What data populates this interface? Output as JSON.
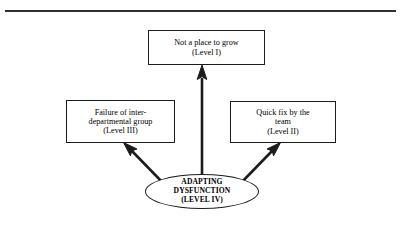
{
  "figure": {
    "type": "flow-diagram",
    "divider": {
      "name": "top-horizontal-rule",
      "color": "#303030"
    },
    "nodes": [
      {
        "id": "level1",
        "shape": "rectangle",
        "lines": [
          "Not a place to grow",
          "(Level I)"
        ],
        "level_label": "(Level I)"
      },
      {
        "id": "level3",
        "shape": "rectangle",
        "lines": [
          "Failure of inter-",
          "departmental group",
          "(Level III)"
        ],
        "level_label": "(Level III)"
      },
      {
        "id": "level2",
        "shape": "rectangle",
        "lines": [
          "Quick fix by the",
          "team",
          "(Level II)"
        ],
        "level_label": "(Level II)"
      },
      {
        "id": "level4",
        "shape": "ellipse",
        "lines": [
          "ADAPTING",
          "DYSFUNCTION",
          "(LEVEL IV)"
        ],
        "level_label": "(LEVEL IV)"
      }
    ],
    "arrows": [
      {
        "id": "arrow-up",
        "from": "level4",
        "to": "level1",
        "direction": "up"
      },
      {
        "id": "arrow-up-left",
        "from": "level4",
        "to": "level3",
        "direction": "up-left"
      },
      {
        "id": "arrow-up-right",
        "from": "level4",
        "to": "level2",
        "direction": "up-right"
      }
    ],
    "colors": {
      "stroke": "#1c1c1c",
      "arrow": "#1c1c1c",
      "background": "#ffffff"
    }
  }
}
